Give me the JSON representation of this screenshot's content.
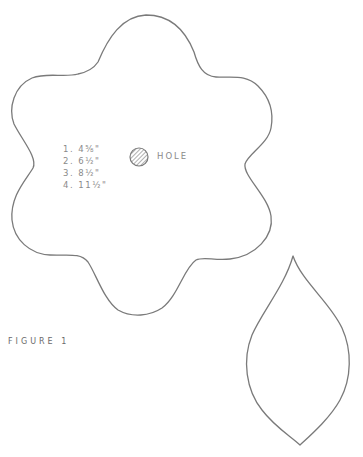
{
  "figure": {
    "caption": "FIGURE 1"
  },
  "flower_template": {
    "sizes": [
      {
        "number": "1.",
        "value": "4⅝\""
      },
      {
        "number": "2.",
        "value": "6½\""
      },
      {
        "number": "3.",
        "value": "8½\""
      },
      {
        "number": "4.",
        "value": "11½\""
      }
    ],
    "hole": {
      "label": "HOLE",
      "icon": "hatched-circle-icon"
    }
  },
  "leaf_template": {
    "shape": "leaf-outline"
  },
  "colors": {
    "outline": "#7a7a7a",
    "text": "#8a8a8a",
    "background": "#ffffff"
  }
}
